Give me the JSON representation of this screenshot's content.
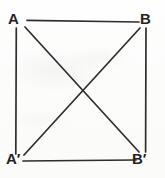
{
  "figure": {
    "kind": "geometry-diagram",
    "background_color": "#fdfdfd",
    "line_color": "#2e2e2e",
    "label_color": "#232323",
    "vertices": [
      {
        "id": "A",
        "label": "A",
        "x": 25,
        "y": 23
      },
      {
        "id": "B",
        "label": "B",
        "x": 142,
        "y": 23
      },
      {
        "id": "Ap",
        "label": "A′",
        "x": 25,
        "y": 158
      },
      {
        "id": "Bp",
        "label": "B′",
        "x": 142,
        "y": 158
      }
    ],
    "edges": [
      {
        "name": "top-side",
        "from": "A",
        "to": "B",
        "x1": 27,
        "y1": 20,
        "x2": 139,
        "y2": 22
      },
      {
        "name": "bottom-side",
        "from": "Ap",
        "to": "Bp",
        "x1": 23,
        "y1": 161,
        "x2": 136,
        "y2": 160
      },
      {
        "name": "left-side",
        "from": "A",
        "to": "Ap",
        "x1": 16,
        "y1": 28,
        "x2": 16,
        "y2": 154
      },
      {
        "name": "right-side",
        "from": "B",
        "to": "Bp",
        "x1": 146,
        "y1": 28,
        "x2": 146,
        "y2": 152
      },
      {
        "name": "diagonal-A-Bp",
        "from": "A",
        "to": "Bp",
        "x1": 25,
        "y1": 27,
        "x2": 139,
        "y2": 152
      },
      {
        "name": "diagonal-B-Ap",
        "from": "B",
        "to": "Ap",
        "x1": 140,
        "y1": 28,
        "x2": 24,
        "y2": 155
      }
    ],
    "intersection": {
      "name": "diagonal-crossing",
      "x": 81,
      "y": 90
    }
  }
}
